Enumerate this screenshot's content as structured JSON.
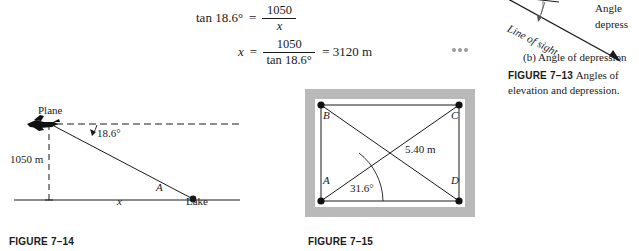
{
  "equations": {
    "line1": {
      "lhs": "tan 18.6°",
      "equals": "=",
      "numerator": "1050",
      "denominator": "x"
    },
    "line2": {
      "lhs": "x",
      "equals": "=",
      "numerator": "1050",
      "denominator": "tan 18.6°",
      "result": "= 3120 m"
    }
  },
  "end_of_example_marker": "•••",
  "figure_713": {
    "angle_word": "Angle",
    "depression_word": "depress",
    "line_of_sight": "Line of sight",
    "subcaption": "(b) Angle of depression",
    "caption_label": "FIGURE 7–13",
    "caption_text": "Angles of elevation and depression."
  },
  "figure_714": {
    "plane_label": "Plane",
    "angle_label": "18.6°",
    "height_label": "1050 m",
    "base_label": "x",
    "point_label": "A",
    "lake_label": "Lake",
    "caption_label": "FIGURE 7–14"
  },
  "figure_715": {
    "corner_b": "B",
    "corner_c": "C",
    "corner_a": "A",
    "corner_d": "D",
    "length_label": "5.40 m",
    "angle_label": "31.6°",
    "caption_label": "FIGURE 7–15"
  },
  "colors": {
    "ink": "#1a1a1a",
    "frame_gray": "#b9b9b9",
    "dot_gray": "#9a9a9a",
    "rule": "#555555"
  }
}
